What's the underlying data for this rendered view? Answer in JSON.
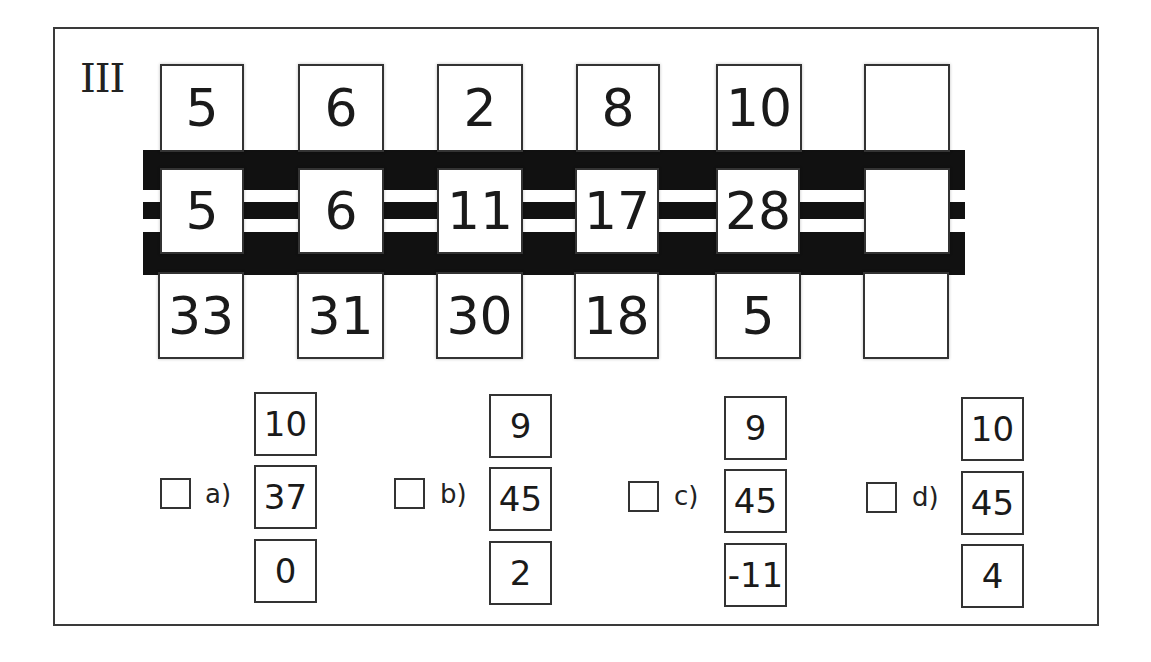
{
  "puzzle": {
    "label": "III",
    "columns": [
      {
        "top": "5",
        "middle": "5",
        "bottom": "33"
      },
      {
        "top": "6",
        "middle": "6",
        "bottom": "31"
      },
      {
        "top": "2",
        "middle": "11",
        "bottom": "30"
      },
      {
        "top": "8",
        "middle": "17",
        "bottom": "18"
      },
      {
        "top": "10",
        "middle": "28",
        "bottom": "5"
      },
      {
        "top": "",
        "middle": "",
        "bottom": ""
      }
    ]
  },
  "options": [
    {
      "label": "a)",
      "checked": false,
      "top": "10",
      "middle": "37",
      "bottom": "0"
    },
    {
      "label": "b)",
      "checked": false,
      "top": "9",
      "middle": "45",
      "bottom": "2"
    },
    {
      "label": "c)",
      "checked": false,
      "top": "9",
      "middle": "45",
      "bottom": "-11"
    },
    {
      "label": "d)",
      "checked": false,
      "top": "10",
      "middle": "45",
      "bottom": "4"
    }
  ]
}
